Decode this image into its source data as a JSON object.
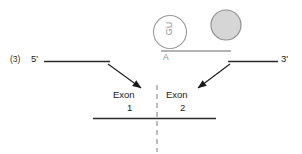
{
  "figure": {
    "step_number": "(3)",
    "left_end_label": "5'",
    "right_end_label": "3'",
    "lariat_branch_label": "GU",
    "branch_point_label": "A",
    "exon1_label": "Exon",
    "exon1_number": "1",
    "exon2_label": "Exon",
    "exon2_number": "2",
    "colors": {
      "exon_line": "#2b2b2b",
      "intron_line": "#9a9a9a",
      "lariat_outline": "#9a9a9a",
      "snrnp_fill": "#d6d6d6",
      "snrnp_outline": "#8f8f8f",
      "arrow": "#1a1a1a",
      "splice_site_dash": "#9a9a9a",
      "background": "#ffffff"
    }
  }
}
